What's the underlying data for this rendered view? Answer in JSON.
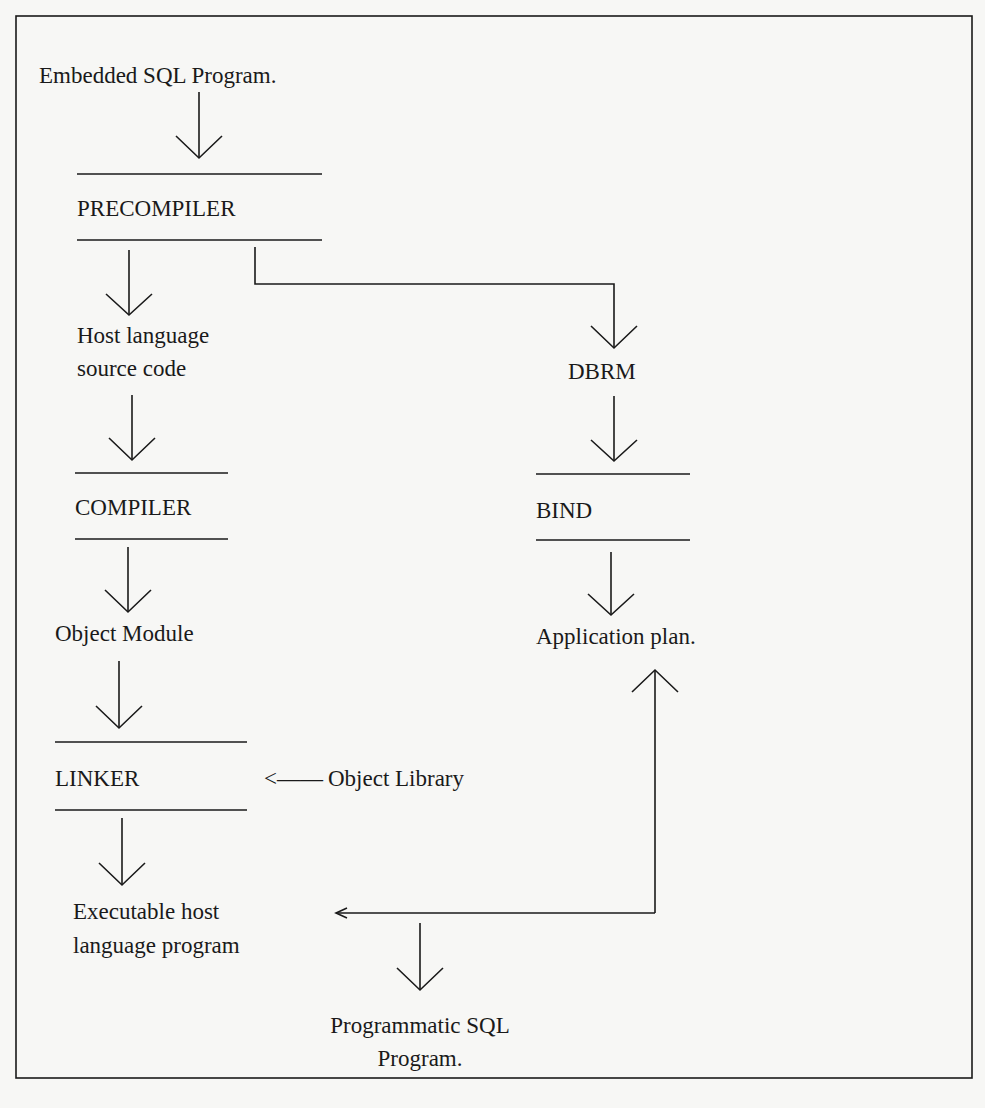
{
  "diagram": {
    "nodes": {
      "start": "Embedded SQL Program.",
      "precompiler": "PRECOMPILER",
      "host_source_line1": "Host language",
      "host_source_line2": "source code",
      "compiler": "COMPILER",
      "object_module": "Object Module",
      "linker": "LINKER",
      "object_library": "Object Library",
      "object_library_arrow": "<——",
      "executable_line1": "Executable host",
      "executable_line2": "language program",
      "dbrm": "DBRM",
      "bind": "BIND",
      "application_plan": "Application plan.",
      "programmatic_line1": "Programmatic SQL",
      "programmatic_line2": "Program."
    },
    "edges": [
      {
        "from": "Embedded SQL Program.",
        "to": "PRECOMPILER"
      },
      {
        "from": "PRECOMPILER",
        "to": "Host language source code"
      },
      {
        "from": "PRECOMPILER",
        "to": "DBRM"
      },
      {
        "from": "Host language source code",
        "to": "COMPILER"
      },
      {
        "from": "COMPILER",
        "to": "Object Module"
      },
      {
        "from": "Object Module",
        "to": "LINKER"
      },
      {
        "from": "Object Library",
        "to": "LINKER"
      },
      {
        "from": "LINKER",
        "to": "Executable host language program"
      },
      {
        "from": "DBRM",
        "to": "BIND"
      },
      {
        "from": "BIND",
        "to": "Application plan."
      },
      {
        "from": "Executable host language program + Application plan.",
        "to": "Programmatic SQL Program."
      }
    ],
    "colors": {
      "ink": "#1a1a1a",
      "paper": "#f7f7f5"
    }
  }
}
